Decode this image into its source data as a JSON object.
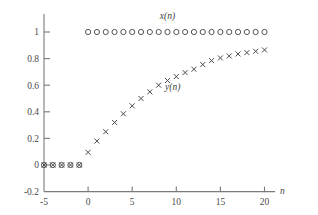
{
  "chart_data": {
    "type": "scatter",
    "title": "",
    "xlabel": "n",
    "ylabel": "",
    "xlim": [
      -5.8,
      21.2
    ],
    "ylim": [
      -0.2,
      1.12
    ],
    "grid": false,
    "legend_position": "inline-annotation",
    "x_ticks": [
      -5,
      0,
      5,
      10,
      15,
      20
    ],
    "x_tick_labels": [
      "-5",
      "0",
      "5",
      "10",
      "15",
      "20"
    ],
    "y_ticks": [
      -0.2,
      0,
      0.2,
      0.4,
      0.6,
      0.8,
      1
    ],
    "y_tick_labels": [
      "-0.2",
      "0",
      "0.2",
      "0.4",
      "0.6",
      "0.8",
      "1"
    ],
    "x": [
      -5,
      -4,
      -3,
      -2,
      -1,
      0,
      1,
      2,
      3,
      4,
      5,
      6,
      7,
      8,
      9,
      10,
      11,
      12,
      13,
      14,
      15,
      16,
      17,
      18,
      19,
      20
    ],
    "series": [
      {
        "name": "x(n)",
        "marker": "circle",
        "label": "x(n)",
        "label_x": 9.0,
        "label_y": 1.1,
        "values": [
          0,
          0,
          0,
          0,
          0,
          1,
          1,
          1,
          1,
          1,
          1,
          1,
          1,
          1,
          1,
          1,
          1,
          1,
          1,
          1,
          1,
          1,
          1,
          1,
          1,
          1
        ]
      },
      {
        "name": "y(n)",
        "marker": "x",
        "label": "y(n)",
        "label_x": 9.6,
        "label_y": 0.565,
        "values": [
          0,
          0,
          0,
          0,
          0,
          0.095,
          0.18,
          0.25,
          0.32,
          0.385,
          0.445,
          0.5,
          0.55,
          0.6,
          0.635,
          0.665,
          0.695,
          0.72,
          0.755,
          0.785,
          0.805,
          0.82,
          0.835,
          0.845,
          0.855,
          0.865
        ]
      }
    ]
  },
  "labels": {
    "x_axis_name": "n",
    "series_x_label": "x(n)",
    "series_y_label": "y(n)"
  },
  "colors": {
    "axis": "#7a7a7a",
    "tick_text": "#4a4a4a",
    "circle_marker": "#555555",
    "x_marker": "#4b4b4b",
    "background": "#ffffff"
  }
}
